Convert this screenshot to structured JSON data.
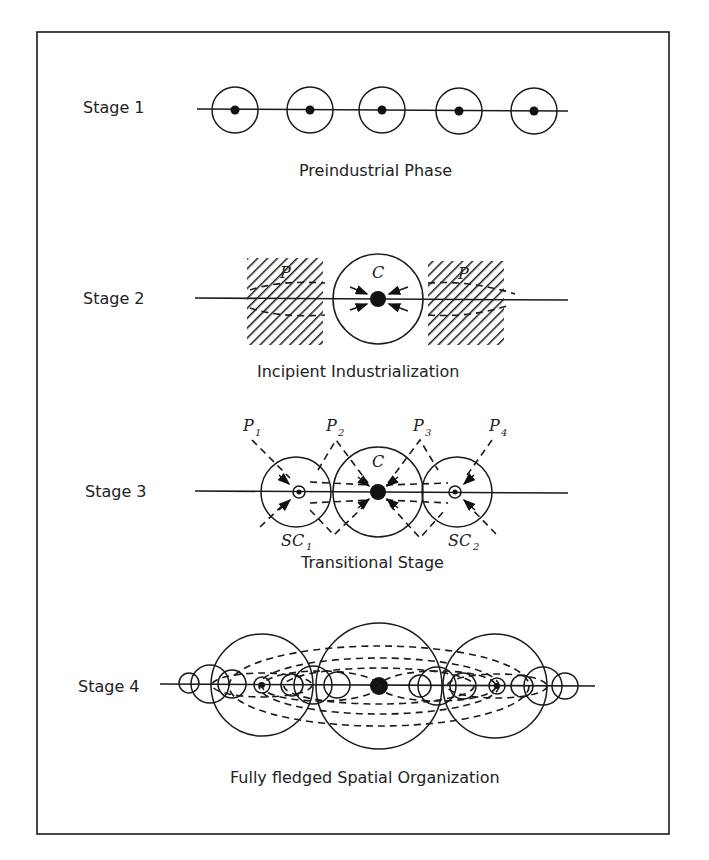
{
  "figure": {
    "frame": {
      "x": 37,
      "y": 32,
      "width": 632,
      "height": 802,
      "color": "#1a1a1a"
    },
    "stages": [
      {
        "label": "Stage 1",
        "caption": "Preindustrial Phase",
        "line_y": 110,
        "centers_x": [
          233,
          307,
          380,
          458,
          532
        ]
      },
      {
        "label": "Stage 2",
        "caption": "Incipient Industrialization",
        "core_label": "C",
        "periphery_labels": [
          "P",
          "P"
        ]
      },
      {
        "label": "Stage 3",
        "caption": "Transitional Stage",
        "core_label": "C",
        "periphery_labels": [
          "P",
          "P",
          "P",
          "P"
        ],
        "periphery_subscripts": [
          "1",
          "2",
          "3",
          "4"
        ],
        "subcenter_labels": [
          "SC",
          "SC"
        ],
        "subcenter_subscripts": [
          "1",
          "2"
        ]
      },
      {
        "label": "Stage 4",
        "caption": "Fully fledged Spatial Organization"
      }
    ]
  }
}
